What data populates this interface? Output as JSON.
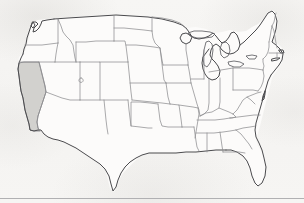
{
  "figure": {
    "type": "choropleth-outline-map",
    "highlighted_region": "California",
    "highlight_color": "#d2d1ce",
    "background_color": "#f6f5f3",
    "state_border_color": "#8d8d90",
    "national_outline_color": "#4a4a4d",
    "width_px": 304,
    "height_px": 203,
    "labels_visible": "none",
    "legend_visible": "none",
    "scale_bar_visible": "none",
    "compass_visible": "none"
  },
  "regions": {
    "highlighted": [
      {
        "name": "California",
        "fill": "#d2d1ce"
      }
    ],
    "unhighlighted_fill": "#fcfbfa"
  },
  "artifacts": {
    "scan_line_y": 198,
    "scan_line_color": "#b0b0b2"
  }
}
